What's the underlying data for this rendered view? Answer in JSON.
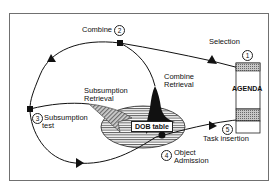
{
  "diagram": {
    "type": "process-cycle",
    "nodes": {
      "agenda": {
        "label": "AGENDA"
      },
      "dob_table": {
        "label": "DOB table"
      }
    },
    "steps": [
      {
        "number": "1",
        "label": "Selection"
      },
      {
        "number": "2",
        "label": "Combine"
      },
      {
        "number": "3",
        "label": "Subsumption test"
      },
      {
        "number": "4",
        "label": "Object Admission"
      },
      {
        "number": "5",
        "label": "Task insertion"
      }
    ],
    "retrievals": [
      {
        "label": "Subsumption Retrieval",
        "line1": "Subsumption",
        "line2": "Retrieval"
      },
      {
        "label": "Combine Retrieval",
        "line1": "Combine",
        "line2": "Retrieval"
      }
    ],
    "step_labels": {
      "selection": "Selection",
      "combine": "Combine",
      "subsumption_test_line1": "Subsumption",
      "subsumption_test_line2": "test",
      "object_admission_line1": "Object",
      "object_admission_line2": "Admission",
      "task_insertion": "Task insertion"
    },
    "colors": {
      "line": "#111111",
      "frame": "#707070",
      "hatch": "#8a8a8a",
      "background": "#ffffff"
    }
  }
}
